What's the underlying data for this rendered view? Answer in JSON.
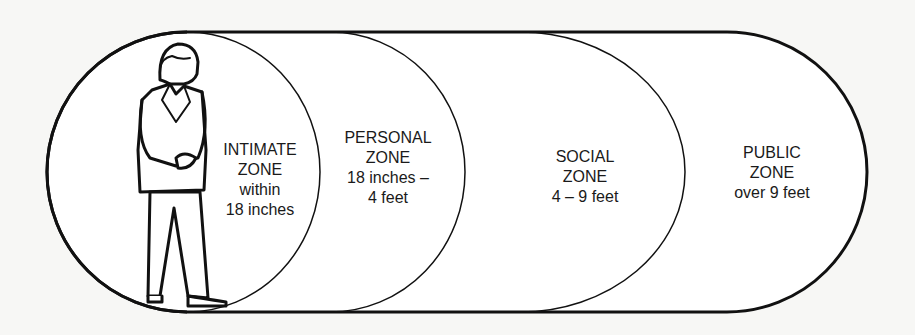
{
  "diagram": {
    "colors": {
      "background": "#f7f7f5",
      "line": "#111111",
      "fill": "#ffffff",
      "text": "#1a1a1a"
    },
    "zones": [
      {
        "id": "intimate",
        "line1": "INTIMATE",
        "line2": "ZONE",
        "line3": "within",
        "line4": "18 inches"
      },
      {
        "id": "personal",
        "line1": "PERSONAL",
        "line2": "ZONE",
        "line3": "18 inches –",
        "line4": "4 feet"
      },
      {
        "id": "social",
        "line1": "SOCIAL",
        "line2": "ZONE",
        "line3": "4 – 9 feet"
      },
      {
        "id": "public",
        "line1": "PUBLIC",
        "line2": "ZONE",
        "line3": "over 9 feet"
      }
    ],
    "figure": "standing man in suit"
  }
}
